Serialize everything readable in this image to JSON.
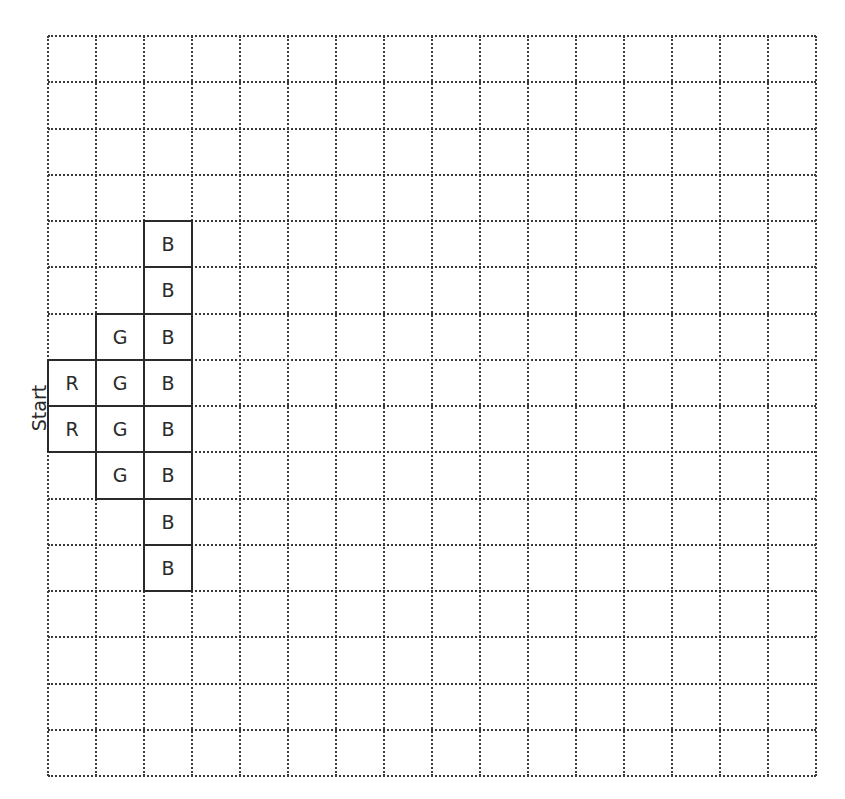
{
  "diagram": {
    "grid": {
      "columns": 16,
      "rows": 16,
      "line_style": "dotted",
      "line_color": "#3a3a3a"
    },
    "start_label": "Start",
    "cells": [
      {
        "row": 4,
        "col": 2,
        "label": "B"
      },
      {
        "row": 5,
        "col": 2,
        "label": "B"
      },
      {
        "row": 6,
        "col": 1,
        "label": "G"
      },
      {
        "row": 6,
        "col": 2,
        "label": "B"
      },
      {
        "row": 7,
        "col": 0,
        "label": "R"
      },
      {
        "row": 7,
        "col": 1,
        "label": "G"
      },
      {
        "row": 7,
        "col": 2,
        "label": "B"
      },
      {
        "row": 8,
        "col": 0,
        "label": "R"
      },
      {
        "row": 8,
        "col": 1,
        "label": "G"
      },
      {
        "row": 8,
        "col": 2,
        "label": "B"
      },
      {
        "row": 9,
        "col": 1,
        "label": "G"
      },
      {
        "row": 9,
        "col": 2,
        "label": "B"
      },
      {
        "row": 10,
        "col": 2,
        "label": "B"
      },
      {
        "row": 11,
        "col": 2,
        "label": "B"
      }
    ]
  }
}
